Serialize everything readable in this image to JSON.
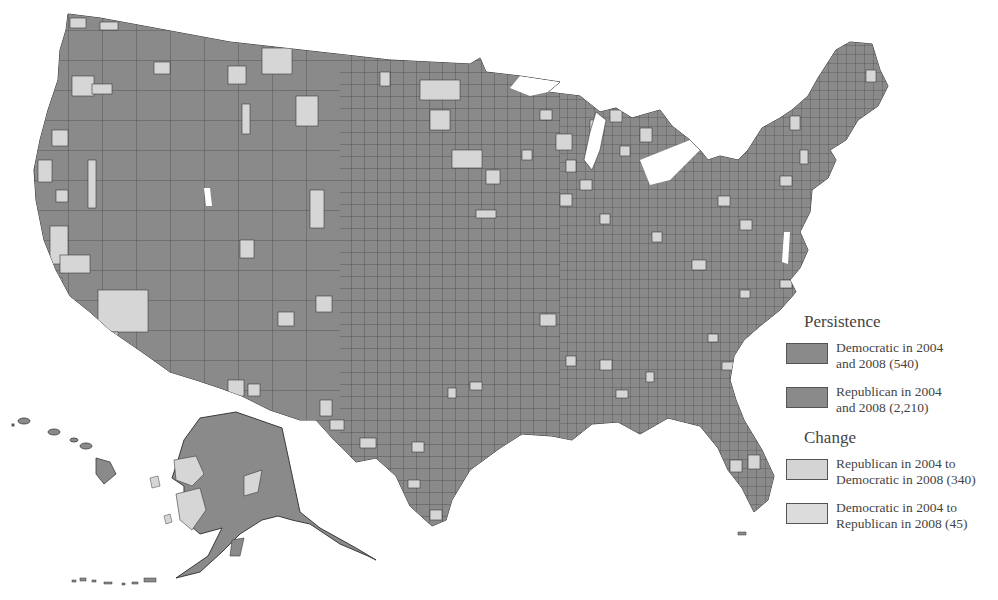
{
  "map": {
    "region": "United States counties",
    "colors": {
      "persistent_fill": "#8a8a8a",
      "change_fill": "#d6d6d6",
      "border": "#3a3a3a",
      "background": "#ffffff"
    }
  },
  "legend": {
    "persistence_heading": "Persistence",
    "change_heading": "Change",
    "items": [
      {
        "line1": "Democratic in 2004",
        "line2": "and 2008 (540)",
        "color": "#8a8a8a",
        "count": 540
      },
      {
        "line1": "Republican in 2004",
        "line2": "and 2008 (2,210)",
        "color": "#8a8a8a",
        "count": 2210
      },
      {
        "line1": "Republican in 2004 to",
        "line2": "Democratic in 2008 (340)",
        "color": "#d4d4d4",
        "count": 340
      },
      {
        "line1": "Democratic in 2004 to",
        "line2": "Republican in 2008 (45)",
        "color": "#dcdcdc",
        "count": 45
      }
    ]
  }
}
